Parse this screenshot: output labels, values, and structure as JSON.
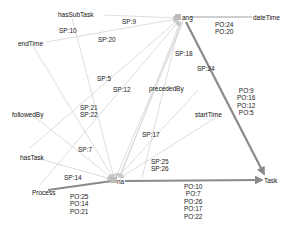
{
  "colors": {
    "thin_edge": "#d4d4d4",
    "thick_edge": "#8a8a8a",
    "text": "#222222",
    "background": "#ffffff"
  },
  "nodes": [
    {
      "id": "ang",
      "label": "ang",
      "x": 182,
      "y": 18
    },
    {
      "id": "na",
      "label": "na",
      "x": 117,
      "y": 181
    },
    {
      "id": "dateTime",
      "label": "dateTime",
      "x": 260,
      "y": 18
    },
    {
      "id": "Task",
      "label": "Task",
      "x": 270,
      "y": 180
    },
    {
      "id": "hasSubTask",
      "label": "hasSubTask",
      "x": 84,
      "y": 15
    },
    {
      "id": "endTime",
      "label": "endTime",
      "x": 32,
      "y": 43
    },
    {
      "id": "followedBy",
      "label": "followedBy",
      "x": 26,
      "y": 114
    },
    {
      "id": "hasTask",
      "label": "hasTask",
      "x": 32,
      "y": 157
    },
    {
      "id": "Process",
      "label": "Process",
      "x": 42,
      "y": 192
    },
    {
      "id": "precededBy",
      "label": "precededBy",
      "x": 204,
      "y": 86
    },
    {
      "id": "startTime",
      "label": "startTime",
      "x": 218,
      "y": 115
    }
  ],
  "edge_labels": [
    {
      "id": "sp9",
      "lines": [
        "SP:9"
      ],
      "x": 120,
      "y": 18
    },
    {
      "id": "sp10",
      "lines": [
        "SP:10"
      ],
      "x": 58,
      "y": 27
    },
    {
      "id": "sp20",
      "lines": [
        "SP:20"
      ],
      "x": 98,
      "y": 36
    },
    {
      "id": "sp5",
      "lines": [
        "SP:5"
      ],
      "x": 96,
      "y": 75
    },
    {
      "id": "sp12",
      "lines": [
        "SP:12"
      ],
      "x": 112,
      "y": 86
    },
    {
      "id": "sp21_22",
      "lines": [
        "SP:21",
        "SP:22"
      ],
      "x": 80,
      "y": 103
    },
    {
      "id": "sp7",
      "lines": [
        "SP:7"
      ],
      "x": 78,
      "y": 146
    },
    {
      "id": "sp14",
      "lines": [
        "SP:14"
      ],
      "x": 64,
      "y": 174
    },
    {
      "id": "sp18",
      "lines": [
        "SP:18"
      ],
      "x": 175,
      "y": 50
    },
    {
      "id": "sp24",
      "lines": [
        "SP:24"
      ],
      "x": 197,
      "y": 65
    },
    {
      "id": "sp17",
      "lines": [
        "SP:17"
      ],
      "x": 142,
      "y": 131
    },
    {
      "id": "sp25_26",
      "lines": [
        "SP:25",
        "SP:26"
      ],
      "x": 151,
      "y": 158
    },
    {
      "id": "po_datetime",
      "lines": [
        "PO:24",
        "PO:20"
      ],
      "x": 215,
      "y": 21
    },
    {
      "id": "po_task_right",
      "lines": [
        "PO:9",
        "PO:16",
        "PO:12",
        "PO:5"
      ],
      "x": 237,
      "y": 86
    },
    {
      "id": "po_task_bottom",
      "lines": [
        "PO:10",
        "PO:7",
        "PO:26",
        "PO:17",
        "PO:22"
      ],
      "x": 185,
      "y": 183
    },
    {
      "id": "po_process",
      "lines": [
        "PO:25",
        "PO:14",
        "PO:21"
      ],
      "x": 70,
      "y": 193
    }
  ]
}
